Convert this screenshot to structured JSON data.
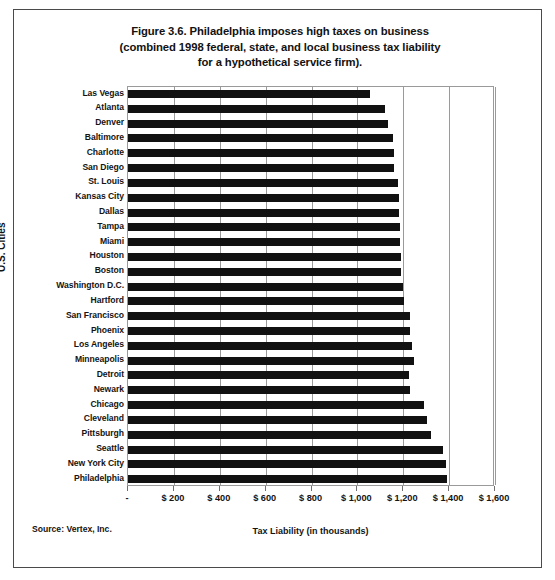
{
  "figure": {
    "title_lines": [
      "Figure 3.6. Philadelphia imposes high taxes on business",
      "(combined 1998 federal, state, and local business tax liability",
      "for a hypothetical service firm)."
    ],
    "source_note": "Source: Vertex, Inc."
  },
  "chart_data": {
    "type": "bar",
    "orientation": "horizontal",
    "title": "Figure 3.6. Philadelphia imposes high taxes on business (combined 1998 federal, state, and local business tax liability for a hypothetical service firm).",
    "xlabel": "Tax Liability (in thousands)",
    "ylabel": "U.S. Cities",
    "xlim": [
      0,
      1600
    ],
    "xticks": [
      0,
      200,
      400,
      600,
      800,
      1000,
      1200,
      1400,
      1600
    ],
    "xticklabels": [
      "-",
      "$ 200",
      "$ 400",
      "$ 600",
      "$ 800",
      "$ 1,000",
      "$ 1,200",
      "$ 1,400",
      "$ 1,600"
    ],
    "grid": "vertical",
    "legend": "none",
    "bar_color": "#111111",
    "categories": [
      "Las Vegas",
      "Atlanta",
      "Denver",
      "Baltimore",
      "Charlotte",
      "San Diego",
      "St. Louis",
      "Kansas City",
      "Dallas",
      "Tampa",
      "Miami",
      "Houston",
      "Boston",
      "Washington D.C.",
      "Hartford",
      "San Francisco",
      "Phoenix",
      "Los Angeles",
      "Minneapolis",
      "Detroit",
      "Newark",
      "Chicago",
      "Cleveland",
      "Pittsburgh",
      "Seattle",
      "New York City",
      "Philadelphia"
    ],
    "values": [
      1055,
      1120,
      1135,
      1155,
      1160,
      1160,
      1175,
      1180,
      1180,
      1185,
      1185,
      1190,
      1190,
      1200,
      1205,
      1230,
      1230,
      1240,
      1245,
      1225,
      1230,
      1290,
      1305,
      1320,
      1375,
      1385,
      1390
    ]
  }
}
